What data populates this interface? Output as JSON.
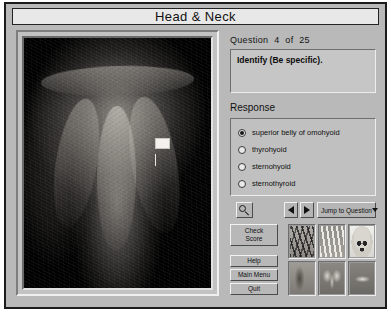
{
  "window": {
    "title": "Head & Neck"
  },
  "question": {
    "counter_prefix": "Question",
    "current": "4",
    "of_label": "of",
    "total": "25",
    "prompt": "Identify (Be specific)."
  },
  "response": {
    "section_label": "Response",
    "options": [
      {
        "label": "superior belly of omohyoid",
        "selected": true
      },
      {
        "label": "thyrohyoid",
        "selected": false
      },
      {
        "label": "sternohyoid",
        "selected": false
      },
      {
        "label": "sternothyroid",
        "selected": false
      }
    ]
  },
  "navigation": {
    "zoom_tool_icon": "magnifier-icon",
    "prev_icon": "triangle-left-icon",
    "next_icon": "triangle-right-icon",
    "jump_label": "Jump to Question",
    "jump_caret_icon": "caret-down-icon"
  },
  "actions": {
    "check_score": "Check\nScore",
    "help": "Help",
    "main_menu": "Main Menu",
    "quit": "Quit"
  },
  "thumbnails": [
    {
      "name": "vessels-and-nerves"
    },
    {
      "name": "hand-bones"
    },
    {
      "name": "skull"
    },
    {
      "name": "trunk"
    },
    {
      "name": "specimen-wing"
    },
    {
      "name": "specimen-horizontal"
    }
  ],
  "image": {
    "caption": "neck dissection specimen",
    "marker": "white-label-flag"
  }
}
